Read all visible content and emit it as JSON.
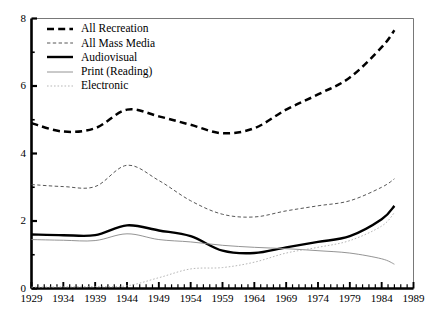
{
  "chart_data": {
    "type": "line",
    "title": "",
    "xlabel": "",
    "ylabel": "",
    "xlim": [
      1929,
      1989
    ],
    "ylim": [
      0,
      8
    ],
    "yticks": [
      0,
      2,
      4,
      6,
      8
    ],
    "ytick_labels": [
      "0",
      "2",
      "4",
      "6",
      "8"
    ],
    "xticks": [
      1929,
      1934,
      1939,
      1944,
      1949,
      1954,
      1959,
      1964,
      1969,
      1974,
      1979,
      1984,
      1989
    ],
    "xtick_labels": [
      "1929",
      "1934",
      "1939",
      "1944",
      "1949",
      "1954",
      "1959",
      "1964",
      "1969",
      "1974",
      "1979",
      "1984",
      "1989"
    ],
    "minor_tick_interval": 1,
    "grid": false,
    "legend_position": "upper-left",
    "x": [
      1929,
      1934,
      1939,
      1944,
      1949,
      1954,
      1959,
      1964,
      1969,
      1974,
      1979,
      1984,
      1986
    ],
    "series": [
      {
        "name": "All Recreation",
        "style": "thick-dashed",
        "color": "#000000",
        "values": [
          4.9,
          4.65,
          4.75,
          5.3,
          5.1,
          4.85,
          4.6,
          4.75,
          5.3,
          5.75,
          6.25,
          7.15,
          7.65
        ]
      },
      {
        "name": "All Mass Media",
        "style": "fine-dashed",
        "color": "#444444",
        "values": [
          3.08,
          3.02,
          3.02,
          3.65,
          3.2,
          2.6,
          2.2,
          2.12,
          2.3,
          2.45,
          2.6,
          3.0,
          3.25
        ]
      },
      {
        "name": "Audiovisual",
        "style": "thick-solid",
        "color": "#000000",
        "values": [
          1.6,
          1.58,
          1.58,
          1.87,
          1.72,
          1.55,
          1.12,
          1.05,
          1.22,
          1.38,
          1.55,
          2.05,
          2.45
        ]
      },
      {
        "name": "Print (Reading)",
        "style": "thin-solid",
        "color": "#888888",
        "values": [
          1.45,
          1.43,
          1.42,
          1.62,
          1.45,
          1.38,
          1.28,
          1.22,
          1.18,
          1.12,
          1.05,
          0.88,
          0.72
        ]
      },
      {
        "name": "Electronic",
        "style": "dotted",
        "color": "#aaaaaa",
        "values": [
          0.04,
          0.05,
          0.06,
          0.08,
          0.32,
          0.58,
          0.62,
          0.78,
          1.05,
          1.22,
          1.42,
          1.85,
          2.25
        ]
      }
    ]
  },
  "legend": {
    "items": [
      {
        "label": "All Recreation"
      },
      {
        "label": "All Mass Media"
      },
      {
        "label": "Audiovisual"
      },
      {
        "label": "Print (Reading)"
      },
      {
        "label": "Electronic"
      }
    ]
  },
  "axes": {
    "y_labels": [
      "8",
      "6",
      "4",
      "2",
      "0"
    ],
    "x_labels": [
      "1929",
      "1934",
      "1939",
      "1944",
      "1949",
      "1954",
      "1959",
      "1964",
      "1969",
      "1974",
      "1979",
      "1984",
      "1989"
    ]
  }
}
